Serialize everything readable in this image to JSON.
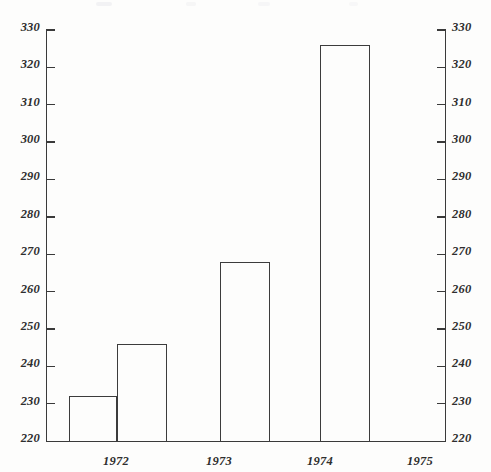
{
  "chart_data": {
    "type": "bar",
    "title": "",
    "subtitle": "",
    "xlabel": "",
    "ylabel": "",
    "categories": [
      "1972",
      "1973",
      "1974",
      "1975"
    ],
    "values": [
      232,
      246,
      268,
      326
    ],
    "series": [
      {
        "name": "",
        "values": [
          232,
          246,
          268,
          326
        ]
      }
    ],
    "ylim": [
      220,
      330
    ],
    "ytick_step": 10,
    "yticks": [
      220,
      230,
      240,
      250,
      260,
      270,
      280,
      290,
      300,
      310,
      320,
      330
    ],
    "ytick_labels": [
      "220",
      "230",
      "240",
      "250",
      "260",
      "270",
      "280",
      "290",
      "300",
      "310",
      "320",
      "330"
    ],
    "right_axis_mirrored": true,
    "right_ytick_labels": [
      "220",
      "230",
      "240",
      "250",
      "260",
      "270",
      "280",
      "290",
      "300",
      "310",
      "320",
      "330"
    ],
    "grid": false,
    "legend": null,
    "legend_position": "none",
    "annotations": [],
    "style": {
      "bar_fill": "none",
      "bar_outline": "#3c3c3c",
      "axis_color": "#3a3a3a",
      "text_color": "#2e2e2e",
      "background": "#fdfdfc"
    }
  }
}
